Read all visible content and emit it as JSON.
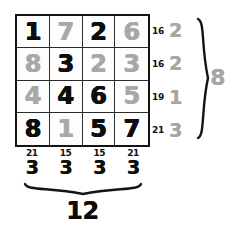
{
  "figure": {
    "colors": {
      "ink_dark": "#0d0d0d",
      "ink_light": "#a8a8a8",
      "grid_line": "#2b2b2b",
      "background": "#ffffff"
    }
  },
  "grid": {
    "rows": 4,
    "cols": 4,
    "cells": [
      [
        {
          "value": "1",
          "shade": "dark"
        },
        {
          "value": "7",
          "shade": "light"
        },
        {
          "value": "2",
          "shade": "dark"
        },
        {
          "value": "6",
          "shade": "light"
        }
      ],
      [
        {
          "value": "8",
          "shade": "light"
        },
        {
          "value": "3",
          "shade": "dark"
        },
        {
          "value": "2",
          "shade": "light"
        },
        {
          "value": "3",
          "shade": "light"
        }
      ],
      [
        {
          "value": "4",
          "shade": "light"
        },
        {
          "value": "4",
          "shade": "dark"
        },
        {
          "value": "6",
          "shade": "dark"
        },
        {
          "value": "5",
          "shade": "light"
        }
      ],
      [
        {
          "value": "8",
          "shade": "dark"
        },
        {
          "value": "1",
          "shade": "light"
        },
        {
          "value": "5",
          "shade": "dark"
        },
        {
          "value": "7",
          "shade": "dark"
        }
      ]
    ]
  },
  "row_annotations": [
    {
      "sum": "16",
      "reduced": "2",
      "shade": "light"
    },
    {
      "sum": "16",
      "reduced": "2",
      "shade": "light"
    },
    {
      "sum": "19",
      "reduced": "1",
      "shade": "light"
    },
    {
      "sum": "21",
      "reduced": "3",
      "shade": "light"
    }
  ],
  "col_annotations": [
    {
      "sum": "21",
      "reduced": "3",
      "shade": "dark"
    },
    {
      "sum": "15",
      "reduced": "3",
      "shade": "dark"
    },
    {
      "sum": "15",
      "reduced": "3",
      "shade": "dark"
    },
    {
      "sum": "21",
      "reduced": "3",
      "shade": "dark"
    }
  ],
  "totals": {
    "right": "8",
    "bottom": "12"
  }
}
